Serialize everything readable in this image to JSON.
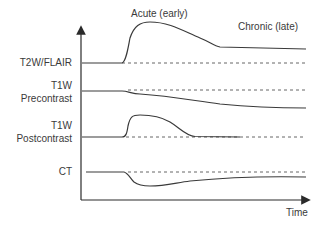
{
  "diagram": {
    "phases": {
      "acute": "Acute (early)",
      "chronic": "Chronic (late)"
    },
    "x_axis_label": "Time",
    "rows": [
      {
        "id": "t2w-flair",
        "label_lines": [
          "T2W/FLAIR"
        ],
        "baseline": "dashed",
        "trend": "sharp rise, gradual decline, stays elevated"
      },
      {
        "id": "t1w-pre",
        "label_lines": [
          "T1W",
          "Precontrast"
        ],
        "baseline": "dashed",
        "trend": "gradual decrease"
      },
      {
        "id": "t1w-post",
        "label_lines": [
          "T1W",
          "Postcontrast"
        ],
        "baseline": "dashed",
        "trend": "sharp rise, then return to baseline"
      },
      {
        "id": "ct",
        "label_lines": [
          "CT"
        ],
        "baseline": "dashed",
        "trend": "sharp drop, gradual recovery below baseline"
      }
    ],
    "colors": {
      "line": "#3a3a3a",
      "text": "#3a3a3a",
      "background": "#ffffff"
    }
  }
}
